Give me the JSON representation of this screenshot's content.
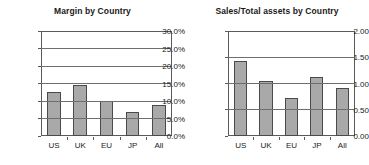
{
  "chart_data": [
    {
      "type": "bar",
      "title": "Margin by Country",
      "categories": [
        "US",
        "UK",
        "EU",
        "JP",
        "All"
      ],
      "values": [
        0.127,
        0.146,
        0.099,
        0.07,
        0.088
      ],
      "tick_labels": [
        "0.0%",
        "5.0%",
        "10.0%",
        "15.0%",
        "20.0%",
        "25.0%",
        "30.0%"
      ],
      "tick_values": [
        0.0,
        0.05,
        0.1,
        0.15,
        0.2,
        0.25,
        0.3
      ],
      "ylim": [
        0.0,
        0.3
      ],
      "xlabel": "",
      "ylabel": "",
      "grid": true,
      "legend": "none",
      "bar_color": "#a9a9a9",
      "bar_edge_color": "#4a4a4a"
    },
    {
      "type": "bar",
      "title": "Sales/Total assets by Country",
      "categories": [
        "US",
        "UK",
        "EU",
        "JP",
        "All"
      ],
      "values": [
        1.42,
        1.05,
        0.72,
        1.13,
        0.91
      ],
      "tick_labels": [
        "0.00",
        "0.50",
        "1.00",
        "1.50",
        "2.00"
      ],
      "tick_values": [
        0.0,
        0.5,
        1.0,
        1.5,
        2.0
      ],
      "ylim": [
        0.0,
        2.0
      ],
      "xlabel": "",
      "ylabel": "",
      "grid": true,
      "legend": "none",
      "bar_color": "#a9a9a9",
      "bar_edge_color": "#4a4a4a"
    }
  ]
}
